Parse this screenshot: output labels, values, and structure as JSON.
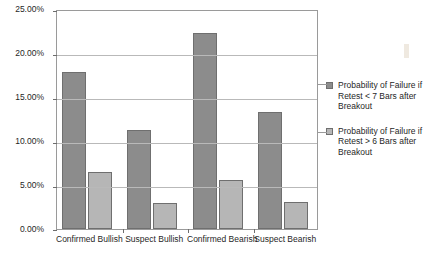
{
  "chart_data": {
    "type": "bar",
    "title": "",
    "xlabel": "",
    "ylabel": "",
    "ylim": [
      0,
      25
    ],
    "ytick_labels": [
      "25.00%",
      "20.00%",
      "15.00%",
      "10.00%",
      "5.00%",
      "0.00%"
    ],
    "ytick_values": [
      25,
      20,
      15,
      10,
      5,
      0
    ],
    "grid": true,
    "legend_position": "right",
    "categories": [
      "Confirmed Bullish",
      "Suspect Bullish",
      "Confirmed Bearish",
      "Suspect Bearish"
    ],
    "series": [
      {
        "name": "Probability of Failure if Retest < 7 Bars after Breakout",
        "color": "#8c8c8c",
        "values": [
          17.8,
          11.3,
          22.3,
          13.3
        ]
      },
      {
        "name": "Probability of Failure if Retest > 6 Bars after Breakout",
        "color": "#b6b6b6",
        "values": [
          6.5,
          3.0,
          5.6,
          3.1
        ]
      }
    ]
  },
  "legend": {
    "entries": [
      {
        "label": "Probability of Failure if Retest < 7 Bars after Breakout"
      },
      {
        "label": "Probability of Failure if Retest > 6 Bars after Breakout"
      }
    ]
  },
  "colors": {
    "series_0": "#8c8c8c",
    "series_1": "#b6b6b6",
    "gridline": "#b9b9b9",
    "axis": "#9a9a9a",
    "text": "#1f1f1f"
  }
}
